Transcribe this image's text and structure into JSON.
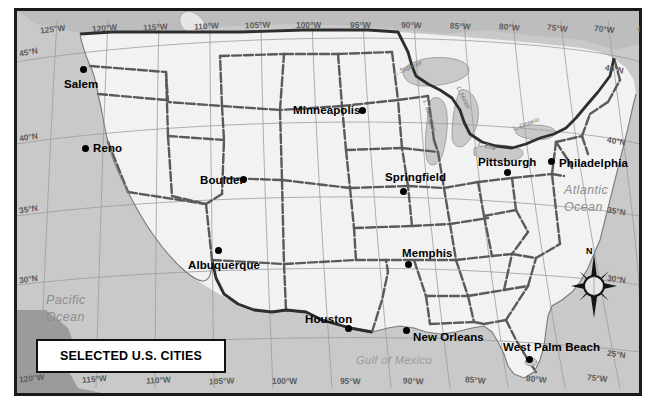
{
  "map": {
    "title": "SELECTED U.S. CITIES",
    "projection_note": "conterminous United States",
    "colors": {
      "ocean": "#c9c9c9",
      "land": "#f2f2f2",
      "border_dark": "#3a3a3a",
      "frame": "#1a1a1a",
      "graticule": "#9a9a9a",
      "label_text": "#000000",
      "water_label": "#8d8d8d"
    },
    "cities": [
      {
        "name": "Salem",
        "x": 75,
        "y": 79,
        "dot_x": 78,
        "dot_y": 64,
        "anchor": "center"
      },
      {
        "name": "Reno",
        "x": 91,
        "y": 148,
        "dot_x": 80,
        "dot_y": 143,
        "anchor": "left"
      },
      {
        "name": "Boulder",
        "x": 198,
        "y": 180,
        "dot_x": 238,
        "dot_y": 173,
        "anchor": "left"
      },
      {
        "name": "Albuquerque",
        "x": 186,
        "y": 259,
        "dot_x": 213,
        "dot_y": 244,
        "anchor": "left"
      },
      {
        "name": "Minneapolis",
        "x": 291,
        "y": 104,
        "dot_x": 357,
        "dot_y": 105,
        "anchor": "left"
      },
      {
        "name": "Springfield",
        "x": 383,
        "y": 171,
        "dot_x": 398,
        "dot_y": 186,
        "anchor": "left"
      },
      {
        "name": "Memphis",
        "x": 400,
        "y": 247,
        "dot_x": 403,
        "dot_y": 259,
        "anchor": "left"
      },
      {
        "name": "Houston",
        "x": 303,
        "y": 313,
        "dot_x": 343,
        "dot_y": 323,
        "anchor": "left"
      },
      {
        "name": "New Orleans",
        "x": 411,
        "y": 331,
        "dot_x": 401,
        "dot_y": 325,
        "anchor": "left"
      },
      {
        "name": "Pittsburgh",
        "x": 476,
        "y": 157,
        "dot_x": 502,
        "dot_y": 167,
        "anchor": "left"
      },
      {
        "name": "Philadelphia",
        "x": 556,
        "y": 159,
        "dot_x": 546,
        "dot_y": 159,
        "anchor": "left"
      },
      {
        "name": "West Palm Beach",
        "x": 501,
        "y": 341,
        "dot_x": 524,
        "dot_y": 354,
        "anchor": "left"
      }
    ],
    "water_bodies": [
      {
        "name": "Pacific\nOcean",
        "x": 47,
        "y": 295,
        "class": "ocean-label"
      },
      {
        "name": "Atlantic\nOcean",
        "x": 566,
        "y": 182,
        "class": "ocean-label"
      },
      {
        "name": "Gulf of Mexico",
        "x": 371,
        "y": 352,
        "class": "gulf-label"
      }
    ],
    "lakes": [
      {
        "name": "L. Superior",
        "x": 407,
        "y": 62,
        "rotate": -20
      },
      {
        "name": "L. Michigan",
        "x": 424,
        "y": 112,
        "rotate": 72
      },
      {
        "name": "L. Huron",
        "x": 457,
        "y": 92,
        "rotate": 62
      },
      {
        "name": "L. Erie",
        "x": 475,
        "y": 135,
        "rotate": 18
      },
      {
        "name": "L. Ontario",
        "x": 508,
        "y": 116,
        "rotate": -22
      }
    ],
    "graticule": {
      "longitude_top": [
        {
          "label": "125°W",
          "x": 43
        },
        {
          "label": "120°W",
          "x": 94
        },
        {
          "label": "115°W",
          "x": 143
        },
        {
          "label": "110°W",
          "x": 193
        },
        {
          "label": "105°W",
          "x": 243
        },
        {
          "label": "100°W",
          "x": 293
        },
        {
          "label": "95°W",
          "x": 345
        },
        {
          "label": "90°W",
          "x": 395
        },
        {
          "label": "85°W",
          "x": 444
        },
        {
          "label": "80°W",
          "x": 492
        },
        {
          "label": "75°W",
          "x": 541
        },
        {
          "label": "70°W",
          "x": 589
        },
        {
          "label": "65°W",
          "x": 633
        }
      ],
      "longitude_bottom": [
        {
          "label": "120°W",
          "x": 22
        },
        {
          "label": "115°W",
          "x": 85
        },
        {
          "label": "110°W",
          "x": 148
        },
        {
          "label": "105°W",
          "x": 211
        },
        {
          "label": "100°W",
          "x": 274
        },
        {
          "label": "95°W",
          "x": 339
        },
        {
          "label": "90°W",
          "x": 401
        },
        {
          "label": "85°W",
          "x": 463
        },
        {
          "label": "80°W",
          "x": 524
        },
        {
          "label": "75°W",
          "x": 585
        }
      ],
      "latitude_left": [
        {
          "label": "45°N",
          "y": 46
        },
        {
          "label": "40°N",
          "y": 131
        },
        {
          "label": "35°N",
          "y": 203
        },
        {
          "label": "30°N",
          "y": 272
        }
      ],
      "latitude_right": [
        {
          "label": "45°N",
          "y": 63
        },
        {
          "label": "40°N",
          "y": 135
        },
        {
          "label": "35°N",
          "y": 205
        },
        {
          "label": "30°N",
          "y": 272
        },
        {
          "label": "25°N",
          "y": 347
        }
      ]
    },
    "compass": {
      "north_label": "N"
    }
  }
}
